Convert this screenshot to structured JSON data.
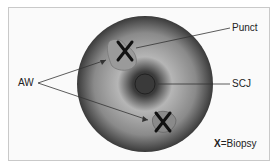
{
  "diagram": {
    "labels": {
      "punct": "Punct",
      "aw": "AW",
      "scj": "SCJ"
    },
    "legend": {
      "symbol": "X",
      "text": "=Biopsy"
    }
  }
}
